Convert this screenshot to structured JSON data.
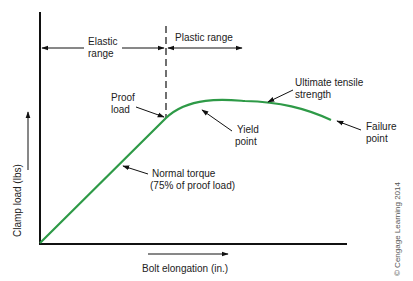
{
  "diagram": {
    "colors": {
      "curve": "#2e9a47",
      "ink": "#111111",
      "text": "#222222",
      "credit": "#555555"
    },
    "axes": {
      "y_label": "Clamp load (lbs)",
      "x_label": "Bolt elongation (in.)"
    },
    "ranges": {
      "elastic_line1": "Elastic",
      "elastic_line2": "range",
      "plastic": "Plastic range"
    },
    "annotations": {
      "proof_load_line1": "Proof",
      "proof_load_line2": "load",
      "yield_line1": "Yield",
      "yield_line2": "point",
      "uts_line1": "Ultimate tensile",
      "uts_line2": "strength",
      "failure_line1": "Failure",
      "failure_line2": "point",
      "normal_torque_line1": "Normal torque",
      "normal_torque_line2": "(75% of proof load)"
    },
    "credit": "© Cengage Learning 2014"
  }
}
